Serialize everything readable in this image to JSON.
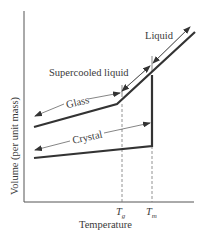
{
  "diagram": {
    "title": "",
    "axes": {
      "x_label": "Temperature",
      "y_label": "Volume (per unit mass)",
      "x_ticks": [
        {
          "symbol": "T",
          "subscript": "g"
        },
        {
          "symbol": "T",
          "subscript": "m"
        }
      ]
    },
    "regions": {
      "liquid": "Liquid",
      "supercooled": "Supercooled liquid",
      "glass": "Glass",
      "crystal": "Crystal"
    },
    "colors": {
      "line": "#333333",
      "axis": "#555555",
      "dashed": "#777777"
    }
  }
}
